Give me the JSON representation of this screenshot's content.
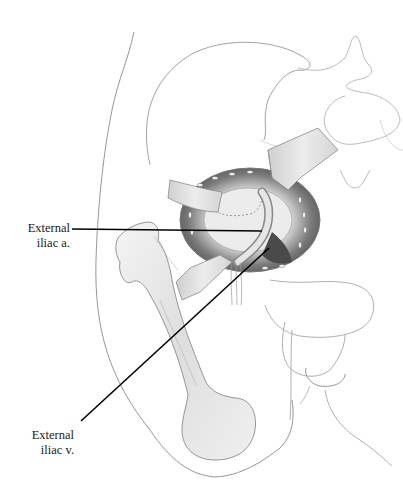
{
  "figure": {
    "colors": {
      "outline": "#8a8a8a",
      "bone_fill": "#e8e8e8",
      "muscle_dark": "#6b6b6b",
      "retractor": "#d9d9d9",
      "leader_line": "#000000"
    }
  },
  "labels": [
    {
      "line1": "External",
      "line2": "iliac a.",
      "target": "external-iliac-artery"
    },
    {
      "line1": "External",
      "line2": "iliac v.",
      "target": "external-iliac-vein"
    }
  ],
  "leader_lines": [
    {
      "from": [
        72,
        229
      ],
      "to": [
        262,
        231
      ]
    },
    {
      "from": [
        81,
        421
      ],
      "to": [
        269,
        248
      ]
    }
  ]
}
